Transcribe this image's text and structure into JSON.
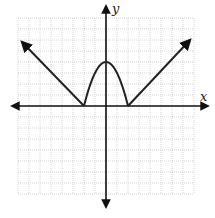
{
  "graph": {
    "x_axis_label": "x",
    "y_axis_label": "y",
    "grid": {
      "x_min": -8,
      "x_max": 8,
      "y_min": -8,
      "y_max": 8,
      "unit_px": 11
    },
    "colors": {
      "curve": "#222222",
      "grid": "#bbbbbb",
      "axis": "#111111"
    },
    "pieces": [
      {
        "type": "ray",
        "from": [
          -2,
          0
        ],
        "toward": [
          -7.7,
          5.8
        ],
        "arrow": true
      },
      {
        "type": "parabola",
        "vertex": [
          0,
          4
        ],
        "roots": [
          -2,
          2
        ]
      },
      {
        "type": "ray",
        "from": [
          2,
          0
        ],
        "toward": [
          7.6,
          6
        ],
        "arrow": true
      }
    ]
  }
}
